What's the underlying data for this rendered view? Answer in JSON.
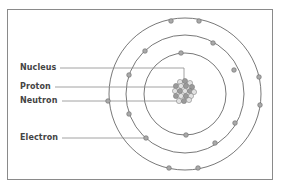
{
  "caption": "(top text cut off)",
  "labels": {
    "nucleus": "Nucleus",
    "proton": "Proton",
    "neutron": "Neutron",
    "electron": "Electron"
  },
  "colors": {
    "ring": "#555555",
    "electron_fill": "#a9a9a9",
    "leader": "#8c8c8c",
    "frame": "#8a8a8a",
    "proton_fill": "#9a9a9a",
    "neutron_fill": "#e2e2e2"
  },
  "atom": {
    "center": [
      185,
      94
    ],
    "rings": [
      41,
      59,
      76
    ],
    "electrons_per_ring": [
      2,
      8,
      7
    ]
  }
}
